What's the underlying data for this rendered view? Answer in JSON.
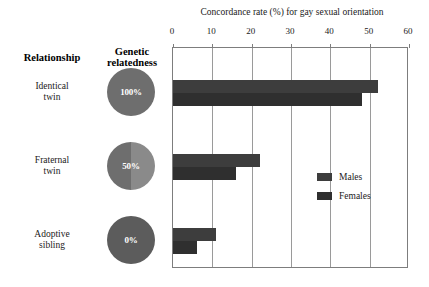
{
  "headers": {
    "relationship": "Relationship",
    "relatedness": "Genetic\nrelatedness"
  },
  "rows": [
    {
      "label": "Identical\ntwin",
      "pie_label": "100%",
      "pie_type": "full"
    },
    {
      "label": "Fraternal\ntwin",
      "pie_label": "50%",
      "pie_type": "half"
    },
    {
      "label": "Adoptive\nsibling",
      "pie_label": "0%",
      "pie_type": "zero"
    }
  ],
  "legend": {
    "males": "Males",
    "females": "Females"
  },
  "colors": {
    "males_bar": "#3d3d3d",
    "females_bar": "#2f2f2f",
    "pie_dark": "#6e6e6e",
    "pie_light": "#8a8a8a",
    "frame": "#7d7d7d"
  },
  "chart_data": {
    "type": "bar",
    "orientation": "horizontal",
    "title": "Concordance rate (%) for gay sexual orientation",
    "xlabel": "",
    "ylabel": "",
    "categories": [
      "Identical twin",
      "Fraternal twin",
      "Adoptive sibling"
    ],
    "series": [
      {
        "name": "Males",
        "values": [
          52,
          22,
          11
        ]
      },
      {
        "name": "Females",
        "values": [
          48,
          16,
          6
        ]
      }
    ],
    "xlim": [
      0,
      60
    ],
    "xticks": [
      0,
      10,
      20,
      30,
      40,
      50,
      60
    ],
    "xticklabels": [
      "0",
      "10",
      "20",
      "30",
      "40",
      "50",
      "60"
    ],
    "grid": true,
    "legend_position": "middle-right",
    "annotations": [
      {
        "category": "Identical twin",
        "genetic_relatedness": "100%"
      },
      {
        "category": "Fraternal twin",
        "genetic_relatedness": "50%"
      },
      {
        "category": "Adoptive sibling",
        "genetic_relatedness": "0%"
      }
    ]
  }
}
